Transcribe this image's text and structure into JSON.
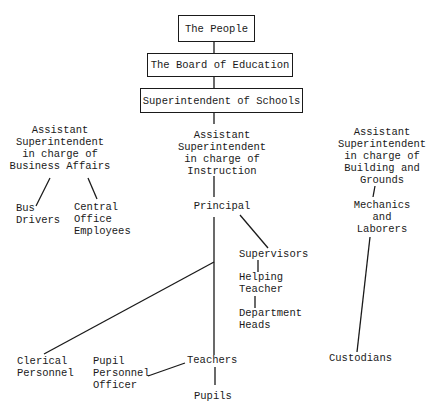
{
  "chart": {
    "type": "organizational-chart",
    "boxes": {
      "people": "The People",
      "board": "The Board of Education",
      "superintendent": "Superintendent of Schools"
    },
    "business": {
      "lines": [
        "Assistant",
        "Superintendent",
        "in charge of",
        "Business Affairs"
      ],
      "bus_drivers": [
        "Bus",
        "Drivers"
      ],
      "central_office": [
        "Central",
        "Office",
        "Employees"
      ]
    },
    "instruction": {
      "lines": [
        "Assistant",
        "Superintendent",
        "in charge of",
        "Instruction"
      ],
      "principal": "Principal",
      "supervisors": "Supervisors",
      "helping_teacher": [
        "Helping",
        "Teacher"
      ],
      "department_heads": [
        "Department",
        "Heads"
      ],
      "clerical": [
        "Clerical",
        "Personnel"
      ],
      "pupil_personnel": [
        "Pupil",
        "Personnel",
        "Officer"
      ],
      "teachers": "Teachers",
      "pupils": "Pupils"
    },
    "buildings": {
      "lines": [
        "Assistant",
        "Superintendent",
        "in charge of",
        "Building and",
        "Grounds"
      ],
      "mechanics": [
        "Mechanics",
        "and",
        "Laborers"
      ],
      "custodians": "Custodians"
    }
  }
}
